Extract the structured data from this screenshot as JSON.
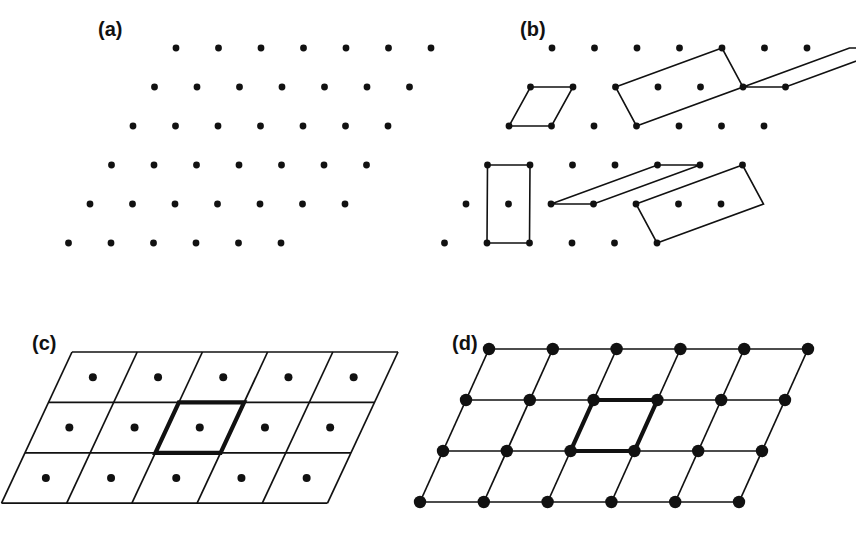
{
  "figure": {
    "ink_color": "#111111",
    "background_color": "#ffffff",
    "width": 856,
    "height": 541
  },
  "panels": [
    {
      "id": "a",
      "label": "(a)",
      "label_x": 98,
      "label_y": 18,
      "caption_text": "(a)",
      "kind": "point-lattice",
      "lattice": {
        "origin_x": 176,
        "origin_y": 48,
        "a_vector": [
          42.5,
          0
        ],
        "b_vector": [
          -21.5,
          39.0
        ],
        "rows": 6,
        "cols_per_row": [
          7,
          7,
          7,
          7,
          7,
          6
        ],
        "dot_radius": 3.4
      }
    },
    {
      "id": "b",
      "label": "(b)",
      "label_x": 520,
      "label_y": 18,
      "caption_text": "(b)",
      "kind": "unit-cell-choices",
      "lattice": {
        "origin_x": 552,
        "origin_y": 48,
        "a_vector": [
          42.5,
          0
        ],
        "b_vector": [
          -21.5,
          39.0
        ],
        "rows": 6,
        "cols_per_row": [
          7,
          7,
          7,
          7,
          7,
          6
        ],
        "dot_radius": 3.4
      },
      "cells": [
        {
          "name": "primitive-cell-1",
          "note": "simple primitive cell, area = 1",
          "points": [
            [
              0,
              1
            ],
            [
              1,
              1
            ],
            [
              1,
              2
            ],
            [
              0,
              2
            ]
          ]
        },
        {
          "name": "primitive-cell-2",
          "note": "skewed primitive cell, area = 1",
          "points": [
            [
              2,
              1
            ],
            [
              4,
              0
            ],
            [
              5,
              1
            ],
            [
              3,
              2
            ]
          ]
        },
        {
          "name": "primitive-cell-3",
          "note": "elongated primitive cell, area = 1",
          "points": [
            [
              5,
              1
            ],
            [
              7,
              0
            ],
            [
              8,
              0
            ],
            [
              6,
              1
            ]
          ]
        },
        {
          "name": "non-primitive-cell-4",
          "note": "double cell containing one interior point, area = 2",
          "points": [
            [
              0,
              3
            ],
            [
              1,
              3
            ],
            [
              2,
              5
            ],
            [
              1,
              5
            ]
          ]
        },
        {
          "name": "primitive-cell-5",
          "note": "very flat primitive cell, area = 1",
          "points": [
            [
              2,
              4
            ],
            [
              4,
              3
            ],
            [
              5,
              3
            ],
            [
              3,
              4
            ]
          ]
        },
        {
          "name": "primitive-cell-6",
          "note": "tilted primitive cell, area = 1",
          "points": [
            [
              4,
              4
            ],
            [
              6,
              3
            ],
            [
              7,
              4
            ],
            [
              5,
              5
            ]
          ]
        }
      ]
    },
    {
      "id": "c",
      "label": "(c)",
      "label_x": 32,
      "label_y": 332,
      "caption_text": "(c)",
      "kind": "tiling-centred",
      "grid": {
        "origin_x": 72,
        "origin_y": 352,
        "a_vector": [
          65.2,
          0
        ],
        "b_vector": [
          -23.5,
          50.4
        ],
        "n_a": 5,
        "n_b": 3,
        "dot_radius": 4.0,
        "dots_at": "cell-centres",
        "highlight_cell": {
          "col": 2,
          "row": 1
        },
        "highlight_note": "bold outlined unit cell containing one lattice point at its centre"
      }
    },
    {
      "id": "d",
      "label": "(d)",
      "label_x": 452,
      "label_y": 332,
      "caption_text": "(d)",
      "kind": "tiling-vertex",
      "grid": {
        "origin_x": 489,
        "origin_y": 349,
        "a_vector": [
          63.8,
          0
        ],
        "b_vector": [
          -23.0,
          51.0
        ],
        "n_a": 5,
        "n_b": 3,
        "dot_radius": 6.2,
        "dots_at": "vertices",
        "highlight_cell": {
          "col": 2,
          "row": 1
        },
        "highlight_note": "bold outlined primitive unit cell with lattice points at its four corners"
      }
    }
  ]
}
